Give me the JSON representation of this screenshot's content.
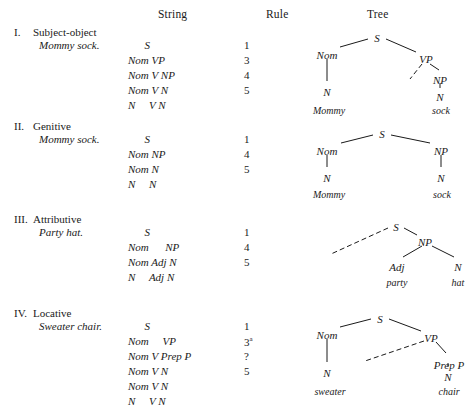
{
  "headers": {
    "string": "String",
    "rule": "Rule",
    "tree": "Tree"
  },
  "sections": [
    {
      "numeral": "I.",
      "title": "Subject-object",
      "example": "Mommy sock.",
      "derivation": [
        {
          "string": "      S",
          "rule": "1"
        },
        {
          "string": "Nom VP",
          "rule": "3"
        },
        {
          "string": "Nom V NP",
          "rule": "4"
        },
        {
          "string": "Nom V N",
          "rule": "5"
        },
        {
          "string": "N     V N",
          "rule": ""
        }
      ],
      "tree": {
        "nodes": [
          {
            "label": "S",
            "x": 77,
            "y": 6
          },
          {
            "label": "Nom",
            "x": 27,
            "y": 23
          },
          {
            "label": "VP",
            "x": 126,
            "y": 27
          },
          {
            "label": "N",
            "x": 27,
            "y": 60
          },
          {
            "label": "NP",
            "x": 140,
            "y": 48
          },
          {
            "label": "N",
            "x": 140,
            "y": 65
          }
        ],
        "leaves": [
          {
            "label": "Mommy",
            "x": 29,
            "y": 79
          },
          {
            "label": "sock",
            "x": 141,
            "y": 79
          }
        ],
        "edges": [
          {
            "x1": 40,
            "y1": 21,
            "x2": 68,
            "y2": 13,
            "dashed": false
          },
          {
            "x1": 86,
            "y1": 13,
            "x2": 116,
            "y2": 26,
            "dashed": false
          },
          {
            "x1": 27,
            "y1": 33,
            "x2": 27,
            "y2": 55,
            "dashed": false
          },
          {
            "x1": 122,
            "y1": 38,
            "x2": 110,
            "y2": 53,
            "dashed": true
          },
          {
            "x1": 130,
            "y1": 38,
            "x2": 139,
            "y2": 44,
            "dashed": false
          },
          {
            "x1": 140,
            "y1": 57,
            "x2": 140,
            "y2": 62,
            "dashed": false
          }
        ]
      }
    },
    {
      "numeral": "II.",
      "title": "Genitive",
      "example": "Mommy sock.",
      "derivation": [
        {
          "string": "      S",
          "rule": "1"
        },
        {
          "string": "Nom NP",
          "rule": "4"
        },
        {
          "string": "Nom N",
          "rule": "5"
        },
        {
          "string": "N     N",
          "rule": ""
        }
      ],
      "tree": {
        "nodes": [
          {
            "label": "S",
            "x": 82,
            "y": 8
          },
          {
            "label": "Nom",
            "x": 27,
            "y": 25
          },
          {
            "label": "NP",
            "x": 141,
            "y": 25
          },
          {
            "label": "N",
            "x": 27,
            "y": 52
          },
          {
            "label": "N",
            "x": 141,
            "y": 52
          }
        ],
        "leaves": [
          {
            "label": "Mommy",
            "x": 29,
            "y": 69
          },
          {
            "label": "sock",
            "x": 142,
            "y": 69
          }
        ],
        "edges": [
          {
            "x1": 41,
            "y1": 23,
            "x2": 73,
            "y2": 15,
            "dashed": false
          },
          {
            "x1": 91,
            "y1": 15,
            "x2": 130,
            "y2": 23,
            "dashed": false
          },
          {
            "x1": 27,
            "y1": 35,
            "x2": 27,
            "y2": 47,
            "dashed": false
          },
          {
            "x1": 141,
            "y1": 35,
            "x2": 141,
            "y2": 47,
            "dashed": false
          }
        ]
      }
    },
    {
      "numeral": "III.",
      "title": "Attributive",
      "example": "Party hat.",
      "derivation": [
        {
          "string": "      S",
          "rule": "1"
        },
        {
          "string": "Nom      NP",
          "rule": "4"
        },
        {
          "string": "Nom Adj N",
          "rule": "5"
        },
        {
          "string": "N     Adj N",
          "rule": ""
        }
      ],
      "tree": {
        "nodes": [
          {
            "label": "S",
            "x": 96,
            "y": 8
          },
          {
            "label": "NP",
            "x": 125,
            "y": 23
          },
          {
            "label": "Adj",
            "x": 97,
            "y": 48
          },
          {
            "label": "N",
            "x": 158,
            "y": 48
          }
        ],
        "leaves": [
          {
            "label": "party",
            "x": 97,
            "y": 64
          },
          {
            "label": "hat",
            "x": 158,
            "y": 64
          }
        ],
        "edges": [
          {
            "x1": 88,
            "y1": 15,
            "x2": 31,
            "y2": 41,
            "dashed": true
          },
          {
            "x1": 104,
            "y1": 15,
            "x2": 117,
            "y2": 22,
            "dashed": false
          },
          {
            "x1": 122,
            "y1": 33,
            "x2": 103,
            "y2": 44,
            "dashed": false
          },
          {
            "x1": 132,
            "y1": 33,
            "x2": 154,
            "y2": 44,
            "dashed": false
          }
        ]
      }
    },
    {
      "numeral": "IV.",
      "title": "Locative",
      "example": "Sweater chair.",
      "derivation": [
        {
          "string": "      S",
          "rule": "1"
        },
        {
          "string": "Nom     VP",
          "rule": "3",
          "rule_sup": "a"
        },
        {
          "string": "Nom V Prep P",
          "rule": "?"
        },
        {
          "string": "Nom V N",
          "rule": "5"
        },
        {
          "string": "Nom V N",
          "rule": ""
        },
        {
          "string": "N     V N",
          "rule": ""
        }
      ],
      "tree": {
        "nodes": [
          {
            "label": "S",
            "x": 80,
            "y": 6
          },
          {
            "label": "Nom",
            "x": 27,
            "y": 22
          },
          {
            "label": "VP",
            "x": 131,
            "y": 25
          },
          {
            "label": "N",
            "x": 27,
            "y": 60
          },
          {
            "label": "Prep P",
            "x": 149,
            "y": 52
          },
          {
            "label": "N",
            "x": 148,
            "y": 64
          }
        ],
        "leaves": [
          {
            "label": "sweater",
            "x": 30,
            "y": 79
          },
          {
            "label": "chair",
            "x": 149,
            "y": 79
          }
        ],
        "edges": [
          {
            "x1": 40,
            "y1": 20,
            "x2": 71,
            "y2": 12,
            "dashed": false
          },
          {
            "x1": 89,
            "y1": 12,
            "x2": 121,
            "y2": 24,
            "dashed": false
          },
          {
            "x1": 27,
            "y1": 32,
            "x2": 27,
            "y2": 55,
            "dashed": false
          },
          {
            "x1": 124,
            "y1": 34,
            "x2": 65,
            "y2": 54,
            "dashed": true
          },
          {
            "x1": 136,
            "y1": 35,
            "x2": 146,
            "y2": 46,
            "dashed": false
          },
          {
            "x1": 148,
            "y1": 56,
            "x2": 148,
            "y2": 60,
            "dashed": false
          }
        ]
      }
    }
  ]
}
